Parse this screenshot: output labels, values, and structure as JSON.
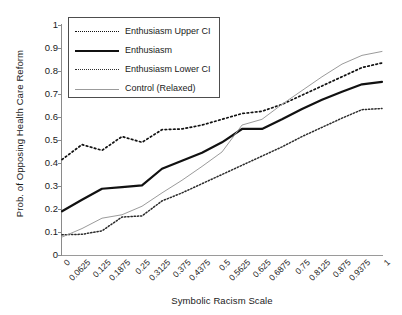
{
  "chart_data": {
    "type": "line",
    "title": "",
    "xlabel": "Symbolic Racism Scale",
    "ylabel": "Prob. of Opposing Health Care Reform",
    "grid": false,
    "legend_position": "upper-left-inside",
    "xlim": [
      0,
      1
    ],
    "ylim": [
      0,
      1
    ],
    "ytick_labels": [
      "1",
      "0.9",
      "0.8",
      "0.7",
      "0.6",
      "0.5",
      "0.4",
      "0.3",
      "0.2",
      "0.1",
      "0"
    ],
    "ytick_values": [
      1,
      0.9,
      0.8,
      0.7,
      0.6,
      0.5,
      0.4,
      0.3,
      0.2,
      0.1,
      0
    ],
    "categories": [
      "0",
      "0.0625",
      "0.125",
      "0.1875",
      "0.25",
      "0.3125",
      "0.375",
      "0.4375",
      "0.5",
      "0.5625",
      "0.625",
      "0.6875",
      "0.75",
      "0.8125",
      "0.875",
      "0.9375",
      "1"
    ],
    "x": [
      0,
      0.0625,
      0.125,
      0.1875,
      0.25,
      0.3125,
      0.375,
      0.4375,
      0.5,
      0.5625,
      0.625,
      0.6875,
      0.75,
      0.8125,
      0.875,
      0.9375,
      1
    ],
    "series": [
      {
        "name": "Enthusiasm Upper CI",
        "style": "dotted-coarse",
        "color": "#111111",
        "values": [
          0.415,
          0.48,
          0.455,
          0.515,
          0.49,
          0.545,
          0.548,
          0.565,
          0.59,
          0.615,
          0.625,
          0.655,
          0.695,
          0.735,
          0.775,
          0.815,
          0.835
        ]
      },
      {
        "name": "Enthusiasm",
        "style": "solid-thick",
        "color": "#111111",
        "values": [
          0.19,
          0.24,
          0.288,
          0.295,
          0.303,
          0.375,
          0.41,
          0.445,
          0.49,
          0.548,
          0.548,
          0.59,
          0.635,
          0.675,
          0.71,
          0.742,
          0.753
        ]
      },
      {
        "name": "Enthusiasm Lower CI",
        "style": "dotted-fine",
        "color": "#2b2b2b",
        "values": [
          0.088,
          0.09,
          0.105,
          0.165,
          0.17,
          0.235,
          0.27,
          0.31,
          0.35,
          0.39,
          0.43,
          0.47,
          0.515,
          0.555,
          0.595,
          0.632,
          0.637
        ]
      },
      {
        "name": "Control (Relaxed)",
        "style": "solid-thin",
        "color": "#9b9b9b",
        "values": [
          0.078,
          0.115,
          0.16,
          0.175,
          0.212,
          0.27,
          0.325,
          0.385,
          0.448,
          0.565,
          0.59,
          0.655,
          0.715,
          0.775,
          0.83,
          0.868,
          0.885
        ]
      }
    ]
  }
}
